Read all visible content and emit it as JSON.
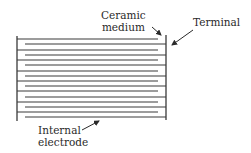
{
  "diagram": {
    "labels": {
      "ceramic_medium": [
        "Ceramic",
        "medium"
      ],
      "terminal": "Terminal",
      "internal_electrode": [
        "Internal",
        "electrode"
      ]
    },
    "terminals": {
      "left_x": 17,
      "right_x": 166,
      "top_y": 36,
      "bottom_y": 121
    },
    "electrodes": {
      "left_attached_y": [
        39,
        50,
        60,
        71,
        81,
        91,
        102,
        112
      ],
      "right_attached_y": [
        44,
        55,
        65,
        76,
        86,
        97,
        107,
        117
      ],
      "left_attached_end_x": 158,
      "right_attached_start_x": 25
    },
    "colors": {
      "line": "#3a3a3a",
      "text": "#2a2a2a",
      "background": "#ffffff"
    }
  }
}
